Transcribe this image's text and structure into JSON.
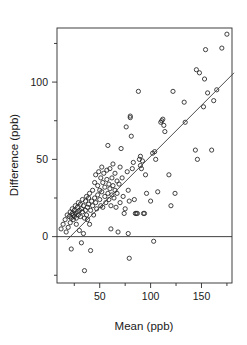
{
  "chart_data": {
    "type": "scatter",
    "title": "",
    "xlabel": "Mean (ppb)",
    "ylabel": "Difference (ppb)",
    "xlim": [
      8,
      180
    ],
    "ylim": [
      -30,
      135
    ],
    "xticks": [
      50,
      100,
      150
    ],
    "xtick_labels": [
      "50",
      "100",
      "150"
    ],
    "xminor_ticks": [
      25,
      75,
      125,
      175
    ],
    "yticks": [
      0,
      50,
      100
    ],
    "ytick_labels": [
      "0",
      "50",
      "100"
    ],
    "yminor_ticks": [
      -25,
      25,
      75,
      125
    ],
    "grid": false,
    "legend": null,
    "marker": "open-circle",
    "annotations": [
      {
        "name": "zero-reference-line",
        "type": "hline",
        "y": 0
      },
      {
        "name": "regression-line",
        "type": "line",
        "x": [
          18,
          182
        ],
        "y": [
          -2,
          106
        ]
      }
    ],
    "points": [
      [
        12,
        5
      ],
      [
        14,
        8
      ],
      [
        16,
        11
      ],
      [
        17,
        3
      ],
      [
        18,
        14
      ],
      [
        19,
        6
      ],
      [
        20,
        13
      ],
      [
        21,
        16
      ],
      [
        21,
        9
      ],
      [
        22,
        12
      ],
      [
        22,
        -8
      ],
      [
        23,
        15
      ],
      [
        23,
        18
      ],
      [
        24,
        11
      ],
      [
        24,
        14
      ],
      [
        25,
        17
      ],
      [
        25,
        13
      ],
      [
        26,
        20
      ],
      [
        26,
        15
      ],
      [
        27,
        12
      ],
      [
        27,
        8
      ],
      [
        28,
        19
      ],
      [
        28,
        16
      ],
      [
        29,
        22
      ],
      [
        29,
        14
      ],
      [
        30,
        4
      ],
      [
        30,
        17
      ],
      [
        31,
        21
      ],
      [
        31,
        13
      ],
      [
        32,
        -4
      ],
      [
        32,
        18
      ],
      [
        33,
        24
      ],
      [
        33,
        16
      ],
      [
        34,
        2
      ],
      [
        34,
        20
      ],
      [
        35,
        -22
      ],
      [
        35,
        12
      ],
      [
        36,
        23
      ],
      [
        36,
        17
      ],
      [
        37,
        26
      ],
      [
        37,
        14
      ],
      [
        38,
        19
      ],
      [
        38,
        11
      ],
      [
        39,
        25
      ],
      [
        39,
        21
      ],
      [
        40,
        8
      ],
      [
        40,
        28
      ],
      [
        41,
        17
      ],
      [
        41,
        -9
      ],
      [
        42,
        23
      ],
      [
        43,
        30
      ],
      [
        43,
        20
      ],
      [
        44,
        14
      ],
      [
        45,
        35
      ],
      [
        45,
        25
      ],
      [
        46,
        40
      ],
      [
        46,
        22
      ],
      [
        47,
        18
      ],
      [
        48,
        33
      ],
      [
        48,
        27
      ],
      [
        49,
        42
      ],
      [
        50,
        24
      ],
      [
        50,
        30
      ],
      [
        51,
        38
      ],
      [
        51,
        20
      ],
      [
        52,
        45
      ],
      [
        52,
        29
      ],
      [
        53,
        35
      ],
      [
        53,
        19
      ],
      [
        54,
        41
      ],
      [
        55,
        26
      ],
      [
        55,
        32
      ],
      [
        56,
        22
      ],
      [
        57,
        37
      ],
      [
        57,
        43
      ],
      [
        58,
        59
      ],
      [
        58,
        28
      ],
      [
        59,
        34
      ],
      [
        59,
        24
      ],
      [
        60,
        44
      ],
      [
        60,
        31
      ],
      [
        61,
        20
      ],
      [
        61,
        5
      ],
      [
        62,
        38
      ],
      [
        62,
        27
      ],
      [
        63,
        47
      ],
      [
        63,
        33
      ],
      [
        64,
        25
      ],
      [
        65,
        41
      ],
      [
        65,
        30
      ],
      [
        66,
        19
      ],
      [
        67,
        36
      ],
      [
        67,
        28
      ],
      [
        68,
        3
      ],
      [
        69,
        34
      ],
      [
        70,
        45
      ],
      [
        70,
        22
      ],
      [
        71,
        57
      ],
      [
        72,
        38
      ],
      [
        73,
        26
      ],
      [
        74,
        15
      ],
      [
        75,
        18
      ],
      [
        76,
        71
      ],
      [
        77,
        42
      ],
      [
        78,
        30
      ],
      [
        78,
        2
      ],
      [
        79,
        23
      ],
      [
        79,
        -14
      ],
      [
        80,
        78
      ],
      [
        80,
        77
      ],
      [
        81,
        65
      ],
      [
        82,
        44
      ],
      [
        83,
        48
      ],
      [
        84,
        24
      ],
      [
        85,
        15
      ],
      [
        86,
        15
      ],
      [
        87,
        15
      ],
      [
        88,
        94
      ],
      [
        89,
        50
      ],
      [
        90,
        46
      ],
      [
        90,
        52
      ],
      [
        91,
        44
      ],
      [
        92,
        49
      ],
      [
        93,
        15
      ],
      [
        94,
        15
      ],
      [
        95,
        40
      ],
      [
        96,
        28
      ],
      [
        100,
        23
      ],
      [
        102,
        54
      ],
      [
        103,
        -3
      ],
      [
        104,
        55
      ],
      [
        105,
        50
      ],
      [
        107,
        29
      ],
      [
        110,
        74
      ],
      [
        111,
        75
      ],
      [
        112,
        76
      ],
      [
        113,
        72
      ],
      [
        114,
        68
      ],
      [
        118,
        40
      ],
      [
        120,
        20
      ],
      [
        122,
        94
      ],
      [
        124,
        28
      ],
      [
        133,
        87
      ],
      [
        134,
        74
      ],
      [
        144,
        56
      ],
      [
        145,
        108
      ],
      [
        146,
        50
      ],
      [
        148,
        106
      ],
      [
        152,
        84
      ],
      [
        153,
        102
      ],
      [
        154,
        121
      ],
      [
        156,
        93
      ],
      [
        160,
        56
      ],
      [
        162,
        88
      ],
      [
        165,
        95
      ],
      [
        170,
        122
      ],
      [
        175,
        131
      ]
    ]
  }
}
